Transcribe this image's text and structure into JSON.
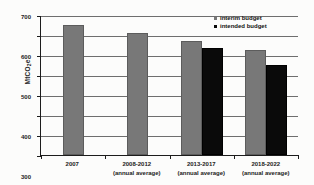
{
  "chart_data": {
    "type": "bar",
    "title": "",
    "xlabel": "",
    "ylabel": "MtCO2e",
    "ylabel_main": "MtCO",
    "ylabel_sub": "2",
    "ylabel_suffix": "e",
    "ylim": [
      0,
      700
    ],
    "ytick_step": 100,
    "yticks": [
      "0",
      "100",
      "200",
      "300",
      "400",
      "500",
      "600",
      "700"
    ],
    "grid": true,
    "legend_position": "top-right",
    "categories": [
      "2007",
      "2008-2012",
      "2013-2017",
      "2018-2022"
    ],
    "category_sublabels": [
      "",
      "(annual average)",
      "(annual average)",
      "(annual average)"
    ],
    "series": [
      {
        "name": "interim budget",
        "color": "#787878",
        "values": [
          650,
          610,
          570,
          525
        ]
      },
      {
        "name": "intended budget",
        "color": "#0a0a0a",
        "values": [
          null,
          null,
          535,
          450
        ]
      }
    ]
  },
  "legend": {
    "items": [
      {
        "label": "interim budget",
        "color": "#787878"
      },
      {
        "label": "intended budget",
        "color": "#0a0a0a"
      }
    ]
  }
}
